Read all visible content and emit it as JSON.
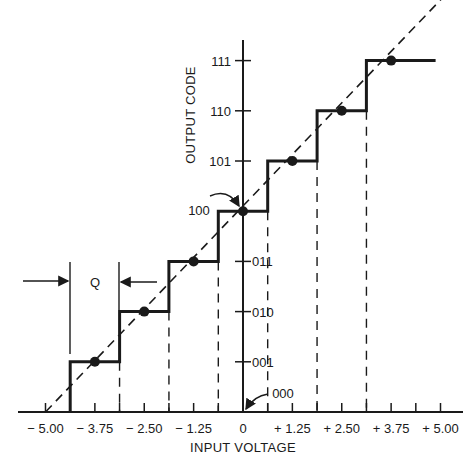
{
  "chart_data": {
    "type": "line",
    "title": "",
    "xlabel": "INPUT VOLTAGE",
    "ylabel": "OUTPUT CODE",
    "xlim": [
      -5.0,
      5.0
    ],
    "x_tick_labels": [
      "− 5.00",
      "− 3.75",
      "− 2.50",
      "− 1.25",
      "0",
      "+ 1.25",
      "+ 2.50",
      "+ 3.75",
      "+ 5.00"
    ],
    "x_tick_values": [
      -5.0,
      -3.75,
      -2.5,
      -1.25,
      0,
      1.25,
      2.5,
      3.75,
      5.0
    ],
    "y_tick_labels": [
      "000",
      "001",
      "010",
      "011",
      "100",
      "101",
      "110",
      "111"
    ],
    "grid": false,
    "legend": null,
    "series": [
      {
        "name": "quantizer transfer (staircase)",
        "style": "solid",
        "x": [
          -4.375,
          -4.375,
          -3.125,
          -3.125,
          -1.875,
          -1.875,
          -0.625,
          -0.625,
          0.625,
          0.625,
          1.875,
          1.875,
          3.125,
          3.125,
          4.875
        ],
        "y": [
          0,
          1,
          1,
          2,
          2,
          3,
          3,
          4,
          4,
          5,
          5,
          6,
          6,
          7,
          7
        ]
      },
      {
        "name": "ideal linear response",
        "style": "dashed",
        "x": [
          -5.0,
          5.0
        ],
        "y": [
          0,
          8
        ]
      },
      {
        "name": "code centers",
        "style": "markers",
        "x": [
          -3.75,
          -2.5,
          -1.25,
          0,
          1.25,
          2.5,
          3.75
        ],
        "y": [
          1,
          2,
          3,
          4,
          5,
          6,
          7
        ]
      }
    ],
    "transition_points": [
      -4.375,
      -3.125,
      -1.875,
      -0.625,
      0.625,
      1.875,
      3.125
    ],
    "annotations": [
      {
        "text": "Q",
        "meaning": "quantization step width",
        "from": -4.375,
        "to": -3.125
      },
      {
        "text": "100",
        "meaning": "arrow pointing to code 100 at 0 V"
      },
      {
        "text": "000",
        "meaning": "arrow pointing to origin code 000"
      }
    ]
  },
  "labels": {
    "xlabel": "INPUT VOLTAGE",
    "ylabel": "OUTPUT CODE",
    "q_label": "Q",
    "code_100_callout": "100",
    "code_000_callout": "000"
  }
}
